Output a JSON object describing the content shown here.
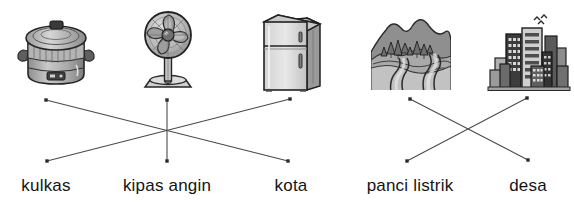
{
  "worksheet": {
    "type": "matching-exercise",
    "title": "",
    "instruction": ""
  },
  "pictures": [
    {
      "id": "pic-rice-cooker",
      "icon_name": "rice-cooker-icon",
      "alt": "panci listrik",
      "x": 14,
      "y": 8,
      "w": 84,
      "h": 84,
      "node_x": 46,
      "node_y": 100
    },
    {
      "id": "pic-electric-fan",
      "icon_name": "electric-fan-icon",
      "alt": "kipas angin",
      "x": 128,
      "y": 6,
      "w": 80,
      "h": 86,
      "node_x": 167,
      "node_y": 100
    },
    {
      "id": "pic-refrigerator",
      "icon_name": "refrigerator-icon",
      "alt": "kulkas",
      "x": 255,
      "y": 10,
      "w": 72,
      "h": 82,
      "node_x": 290,
      "node_y": 99
    },
    {
      "id": "pic-village",
      "icon_name": "village-landscape-icon",
      "alt": "desa",
      "x": 369,
      "y": 8,
      "w": 84,
      "h": 84,
      "node_x": 410,
      "node_y": 99
    },
    {
      "id": "pic-city",
      "icon_name": "city-skyline-icon",
      "alt": "kota",
      "x": 487,
      "y": 8,
      "w": 84,
      "h": 84,
      "node_x": 527,
      "node_y": 98
    }
  ],
  "labels": [
    {
      "id": "label-kulkas",
      "text": "kulkas",
      "x": 46,
      "y": 185,
      "node_x": 47,
      "node_y": 161
    },
    {
      "id": "label-kipas-angin",
      "text": "kipas angin",
      "x": 167,
      "y": 185,
      "node_x": 167,
      "node_y": 161
    },
    {
      "id": "label-kota",
      "text": "kota",
      "x": 291,
      "y": 185,
      "node_x": 288,
      "node_y": 161
    },
    {
      "id": "label-panci-listrik",
      "text": "panci listrik",
      "x": 410,
      "y": 185,
      "node_x": 407,
      "node_y": 161
    },
    {
      "id": "label-desa",
      "text": "desa",
      "x": 528,
      "y": 185,
      "node_x": 528,
      "node_y": 160
    }
  ],
  "connections": [
    {
      "id": "connection-rice-cooker-to-kota",
      "from": "pic-rice-cooker",
      "to": "label-kota",
      "x1": 46,
      "y1": 100,
      "x2": 288,
      "y2": 161
    },
    {
      "id": "connection-fan-to-kipas-angin",
      "from": "pic-electric-fan",
      "to": "label-kipas-angin",
      "x1": 167,
      "y1": 100,
      "x2": 167,
      "y2": 161
    },
    {
      "id": "connection-refrigerator-to-kulkas",
      "from": "pic-refrigerator",
      "to": "label-kulkas",
      "x1": 290,
      "y1": 99,
      "x2": 47,
      "y2": 161
    },
    {
      "id": "connection-village-to-desa",
      "from": "pic-village",
      "to": "label-desa",
      "x1": 410,
      "y1": 99,
      "x2": 528,
      "y2": 160
    },
    {
      "id": "connection-city-to-panci-listrik",
      "from": "pic-city",
      "to": "label-panci-listrik",
      "x1": 527,
      "y1": 98,
      "x2": 407,
      "y2": 161
    }
  ],
  "colors": {
    "line": "#4a4a4a",
    "node": "#2b2b2b",
    "text": "#141414",
    "background": "#ffffff"
  }
}
